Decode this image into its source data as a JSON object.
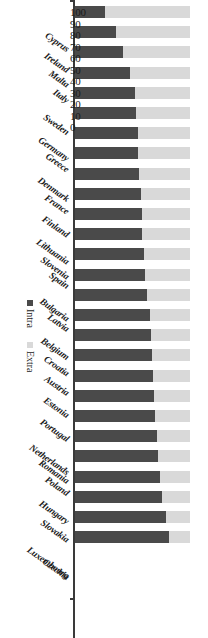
{
  "chart_data": {
    "type": "bar",
    "title": "",
    "subtitle": "",
    "xlabel": "",
    "ylabel": "",
    "orientation": "horizontal-stacked",
    "stacked": true,
    "stack_total": 100,
    "ylim": [
      0,
      100
    ],
    "axis_ticks": [
      "100",
      "90",
      "80",
      "70",
      "60",
      "50",
      "40",
      "30",
      "20",
      "10",
      "0"
    ],
    "grid": false,
    "legend_position": "bottom-right",
    "categories": [
      "Cyprus",
      "Ireland",
      "Malta",
      "Italy",
      "Sweden",
      "Germany",
      "Greece",
      "Denmark",
      "France",
      "Finland",
      "Lithuania",
      "Slovenia",
      "Spain",
      "Bulgaria",
      "Latvia",
      "Belgium",
      "Croatia",
      "Austria",
      "Estonia",
      "Portugal",
      "Netherlands",
      "Romania",
      "Poland",
      "Hungary",
      "Slovakia",
      "Luxembourg",
      "Czechia"
    ],
    "series": [
      {
        "name": "Intra",
        "color": "#4a4a4a",
        "values": [
          26,
          36,
          42,
          48,
          52,
          53,
          55,
          55,
          56,
          57,
          58,
          58,
          60,
          61,
          63,
          65,
          66,
          67,
          68,
          69,
          70,
          71,
          72,
          74,
          76,
          79,
          82
        ]
      },
      {
        "name": "Extra",
        "color": "#d9d9d9",
        "values": [
          74,
          64,
          58,
          52,
          48,
          47,
          45,
          45,
          44,
          43,
          42,
          42,
          40,
          39,
          37,
          35,
          34,
          33,
          32,
          31,
          30,
          29,
          28,
          26,
          24,
          21,
          18
        ]
      }
    ],
    "legend": [
      {
        "label": "Intra",
        "color": "#4a4a4a"
      },
      {
        "label": "Extra",
        "color": "#d9d9d9"
      }
    ]
  }
}
